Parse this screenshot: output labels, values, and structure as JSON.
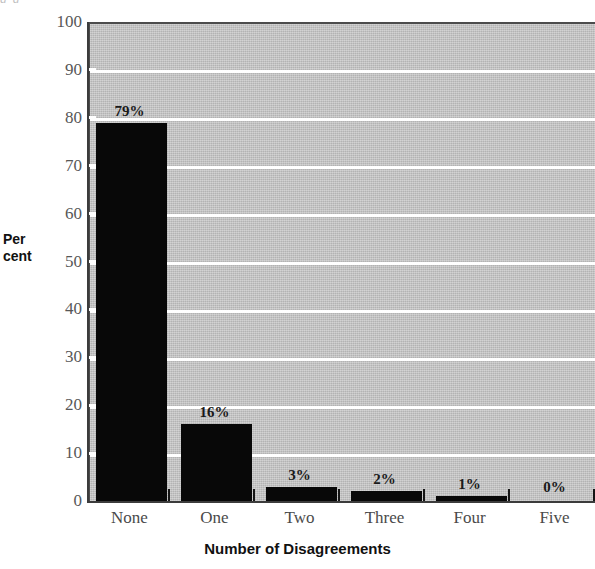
{
  "figure": {
    "cut_caption": "g                    g",
    "yaxis_title_line1": "Per",
    "yaxis_title_line2": "cent",
    "xaxis_title": "Number of Disagreements"
  },
  "chart_data": {
    "type": "bar",
    "title": "",
    "subtitle": "",
    "xlabel": "Number of Disagreements",
    "ylabel": "Per cent",
    "categories": [
      "None",
      "One",
      "Two",
      "Three",
      "Four",
      "Five"
    ],
    "values": [
      79,
      16,
      3,
      2,
      1,
      0
    ],
    "data_labels": [
      "79%",
      "16%",
      "3%",
      "2%",
      "1%",
      "0%"
    ],
    "ylim": [
      0,
      100
    ],
    "ytick_labels": [
      "0",
      "10",
      "20",
      "30",
      "40",
      "50",
      "60",
      "70",
      "80",
      "90",
      "100"
    ],
    "ytick_values": [
      0,
      10,
      20,
      30,
      40,
      50,
      60,
      70,
      80,
      90,
      100
    ],
    "grid": "horizontal",
    "legend": "none",
    "colors": {
      "bar": "#080808",
      "plot_background": "#c6c6c6",
      "gridline": "#ffffff",
      "axis": "#3c3c3c",
      "tick_label": "#575757",
      "title_text": "#111111"
    }
  }
}
